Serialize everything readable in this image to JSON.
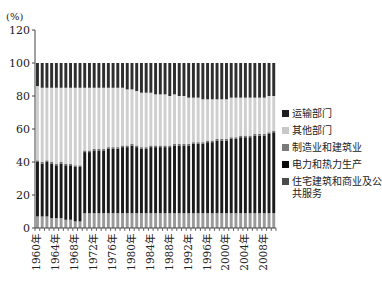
{
  "chart_data": {
    "type": "bar",
    "stacked": true,
    "title": "",
    "xlabel": "",
    "ylabel": "(%)",
    "ylim": [
      0,
      120
    ],
    "yticks": [
      0,
      20,
      40,
      60,
      80,
      100,
      120
    ],
    "grid": false,
    "legend_position": "right",
    "x_tick_labels": [
      "1960年",
      "1964年",
      "1968年",
      "1972年",
      "1976年",
      "1980年",
      "1984年",
      "1988年",
      "1992年",
      "1996年",
      "2000年",
      "2004年",
      "2008年"
    ],
    "categories": [
      1960,
      1961,
      1962,
      1963,
      1964,
      1965,
      1966,
      1967,
      1968,
      1969,
      1970,
      1971,
      1972,
      1973,
      1974,
      1975,
      1976,
      1977,
      1978,
      1979,
      1980,
      1981,
      1982,
      1983,
      1984,
      1985,
      1986,
      1987,
      1988,
      1989,
      1990,
      1991,
      1992,
      1993,
      1994,
      1995,
      1996,
      1997,
      1998,
      1999,
      2000,
      2001,
      2002,
      2003,
      2004,
      2005,
      2006,
      2007,
      2008,
      2009,
      2010
    ],
    "series": [
      {
        "name": "住宅建筑和商业及公共服务",
        "color": "#9a9a9a",
        "values": [
          7,
          7,
          7,
          6,
          6,
          6,
          5,
          5,
          4,
          4,
          9,
          9,
          9,
          9,
          9,
          9,
          9,
          9,
          9,
          9,
          9,
          9,
          9,
          9,
          9,
          9,
          9,
          9,
          9,
          9,
          9,
          9,
          9,
          9,
          9,
          9,
          9,
          9,
          9,
          9,
          9,
          9,
          9,
          9,
          9,
          9,
          9,
          9,
          9,
          9,
          9
        ]
      },
      {
        "name": "电力和热力生产",
        "color": "#1a1a1a",
        "values": [
          33,
          32,
          33,
          33,
          32,
          33,
          33,
          33,
          33,
          33,
          37,
          37,
          38,
          38,
          38,
          39,
          39,
          39,
          40,
          40,
          41,
          40,
          39,
          39,
          40,
          40,
          40,
          40,
          40,
          41,
          41,
          41,
          41,
          42,
          42,
          42,
          43,
          43,
          44,
          44,
          44,
          45,
          45,
          46,
          46,
          46,
          47,
          47,
          47,
          48,
          49
        ]
      },
      {
        "name": "制造业和建筑业",
        "color": "#6e6e6e",
        "values": [
          1,
          1,
          1,
          1,
          1,
          1,
          1,
          1,
          1,
          1,
          1,
          1,
          1,
          1,
          1,
          1,
          1,
          1,
          1,
          1,
          1,
          1,
          1,
          1,
          1,
          1,
          1,
          1,
          1,
          1,
          1,
          1,
          1,
          1,
          1,
          1,
          1,
          1,
          1,
          1,
          1,
          1,
          1,
          1,
          1,
          1,
          1,
          1,
          1,
          1,
          1
        ]
      },
      {
        "name": "其他部门",
        "color": "#cfcfcf",
        "values": [
          45,
          45,
          44,
          45,
          46,
          45,
          46,
          46,
          47,
          47,
          38,
          38,
          37,
          37,
          37,
          36,
          36,
          36,
          35,
          34,
          33,
          33,
          33,
          33,
          32,
          31,
          31,
          31,
          30,
          30,
          29,
          29,
          28,
          27,
          27,
          26,
          25,
          25,
          24,
          24,
          24,
          24,
          24,
          23,
          23,
          23,
          22,
          22,
          22,
          22,
          21
        ]
      },
      {
        "name": "运输部门",
        "color": "#2e2e2e",
        "values": [
          14,
          15,
          15,
          15,
          15,
          15,
          15,
          15,
          15,
          15,
          15,
          15,
          15,
          15,
          15,
          15,
          15,
          15,
          15,
          16,
          16,
          17,
          18,
          18,
          18,
          19,
          19,
          19,
          20,
          19,
          20,
          20,
          21,
          21,
          21,
          22,
          22,
          22,
          22,
          22,
          22,
          21,
          21,
          21,
          21,
          21,
          21,
          21,
          21,
          20,
          20
        ]
      }
    ]
  },
  "legend": {
    "items": [
      {
        "label": "运输部门",
        "color": "#1e1e1e"
      },
      {
        "label": "其他部门",
        "color": "#c8c8c8"
      },
      {
        "label": "制造业和建筑业",
        "color": "#7a7a7a"
      },
      {
        "label": "电力和热力生产",
        "color": "#0a0a0a"
      },
      {
        "label": "住宅建筑和商业及公共服务",
        "color": "#4a4a4a"
      }
    ]
  },
  "axis": {
    "unit_label": "(%)"
  }
}
